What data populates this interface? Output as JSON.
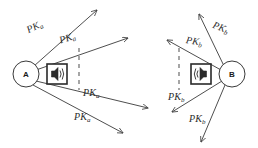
{
  "diagram": {
    "background_color": "#ffffff",
    "stroke_color": "#3a3a3a",
    "dashed_color": "#6b6b6b",
    "nodes": [
      {
        "id": "node-a",
        "label": "A",
        "cx": 26,
        "cy": 74,
        "r": 13,
        "icon": "speaker-icon",
        "icon_direction": "right",
        "icon_x": 47,
        "icon_y": 64,
        "icon_size": 20,
        "dashed_line": {
          "x": 79,
          "y1": 48,
          "y2": 90
        }
      },
      {
        "id": "node-b",
        "label": "B",
        "cx": 232,
        "cy": 74,
        "r": 13,
        "icon": "speaker-icon",
        "icon_direction": "left",
        "icon_x": 191,
        "icon_y": 64,
        "icon_size": 20,
        "dashed_line": {
          "x": 179,
          "y1": 48,
          "y2": 90
        }
      }
    ],
    "arrows": [
      {
        "id": "a-arrow-1",
        "node": "A",
        "x1": 34,
        "y1": 66,
        "x2": 97,
        "y2": 10
      },
      {
        "id": "a-arrow-2",
        "node": "A",
        "x1": 36,
        "y1": 70,
        "x2": 128,
        "y2": 38
      },
      {
        "id": "a-arrow-3",
        "node": "A",
        "x1": 36,
        "y1": 81,
        "x2": 148,
        "y2": 108
      },
      {
        "id": "a-arrow-4",
        "node": "A",
        "x1": 33,
        "y1": 85,
        "x2": 123,
        "y2": 133
      },
      {
        "id": "b-arrow-1",
        "node": "B",
        "x1": 224,
        "y1": 66,
        "x2": 199,
        "y2": 14
      },
      {
        "id": "b-arrow-2",
        "node": "B",
        "x1": 221,
        "y1": 70,
        "x2": 167,
        "y2": 40
      },
      {
        "id": "b-arrow-3",
        "node": "B",
        "x1": 222,
        "y1": 81,
        "x2": 172,
        "y2": 112
      },
      {
        "id": "b-arrow-4",
        "node": "B",
        "x1": 225,
        "y1": 85,
        "x2": 201,
        "y2": 142
      }
    ],
    "labels": [
      {
        "id": "pk-a-label-1",
        "base": "PK",
        "sub": "a",
        "x": 25,
        "y": 26,
        "rotate": -26
      },
      {
        "id": "pk-a-label-2",
        "base": "PK",
        "sub": "a",
        "x": 58,
        "y": 36,
        "rotate": -18
      },
      {
        "id": "pk-a-label-3",
        "base": "PK",
        "sub": "a",
        "x": 83,
        "y": 88,
        "rotate": 0
      },
      {
        "id": "pk-a-label-4",
        "base": "PK",
        "sub": "a",
        "x": 74,
        "y": 112,
        "rotate": 0
      },
      {
        "id": "pk-b-label-1",
        "base": "PK",
        "sub": "b",
        "x": 215,
        "y": 20,
        "rotate": 22
      },
      {
        "id": "pk-b-label-2",
        "base": "PK",
        "sub": "b",
        "x": 187,
        "y": 35,
        "rotate": 10
      },
      {
        "id": "pk-b-label-3",
        "base": "PK",
        "sub": "b",
        "x": 168,
        "y": 92,
        "rotate": 0
      },
      {
        "id": "pk-b-label-4",
        "base": "PK",
        "sub": "b",
        "x": 189,
        "y": 114,
        "rotate": 0
      }
    ]
  }
}
